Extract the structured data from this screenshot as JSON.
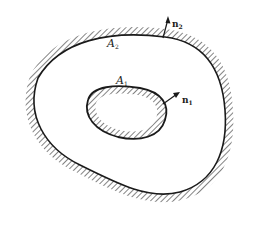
{
  "figure": {
    "type": "region-boundary-diagram",
    "ink_color": "#1a1a1a",
    "background": "#ffffff"
  },
  "outer_boundary": {
    "label": "A",
    "subscript": "2",
    "hatching": "outside"
  },
  "inner_boundary": {
    "label": "A",
    "subscript": "1",
    "hatching": "inside"
  },
  "normals": [
    {
      "label": "n",
      "subscript": "2",
      "attached_to": "outer_boundary"
    },
    {
      "label": "n",
      "subscript": "1",
      "attached_to": "inner_boundary"
    }
  ]
}
